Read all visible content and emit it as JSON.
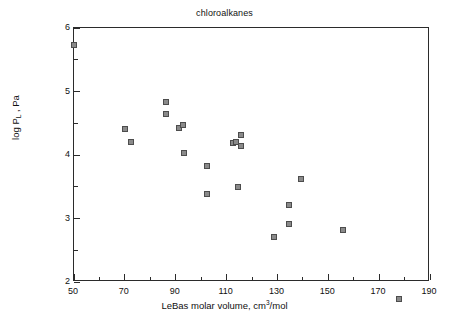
{
  "chart_data": {
    "type": "scatter",
    "title": "chloroalkanes",
    "xlabel_parts": {
      "prefix": "LeBas molar volume, cm",
      "superscript": "3",
      "suffix": "/mol"
    },
    "xlabel": "LeBas molar volume, cm3/mol",
    "ylabel_parts": {
      "prefix": "log P",
      "subscript": "L",
      "suffix": " , Pa"
    },
    "ylabel": "log P_L , Pa",
    "xlim": [
      50,
      190
    ],
    "ylim": [
      2,
      6
    ],
    "xticks": [
      50,
      70,
      90,
      110,
      130,
      150,
      170,
      190
    ],
    "xticklabels": [
      "50",
      "70",
      "90",
      "110",
      "130",
      "150",
      "170",
      "190"
    ],
    "xminorticks": [
      60,
      80,
      100,
      120,
      140,
      160,
      180
    ],
    "yticks": [
      2,
      3,
      4,
      5,
      6
    ],
    "yticklabels": [
      "2",
      "3",
      "4",
      "5",
      "6"
    ],
    "yminorticks": [
      2.5,
      3.5,
      4.5,
      5.5
    ],
    "grid": false,
    "legend": null,
    "marker": {
      "shape": "square",
      "fill_color": "#8a8a8a",
      "edge_color": "#4d4d4d",
      "size_px": 6
    },
    "frame_color": "#2b2b2b",
    "background_color": "#ffffff",
    "points": [
      {
        "x": 50.0,
        "y": 5.74
      },
      {
        "x": 70.1,
        "y": 4.41
      },
      {
        "x": 72.4,
        "y": 4.2
      },
      {
        "x": 86.2,
        "y": 4.84
      },
      {
        "x": 86.2,
        "y": 4.65
      },
      {
        "x": 91.3,
        "y": 4.42
      },
      {
        "x": 92.9,
        "y": 4.47
      },
      {
        "x": 93.3,
        "y": 4.03
      },
      {
        "x": 102.3,
        "y": 3.82
      },
      {
        "x": 102.3,
        "y": 3.39
      },
      {
        "x": 112.5,
        "y": 4.19
      },
      {
        "x": 113.7,
        "y": 4.21
      },
      {
        "x": 115.7,
        "y": 4.31
      },
      {
        "x": 115.7,
        "y": 4.14
      },
      {
        "x": 114.5,
        "y": 3.5
      },
      {
        "x": 128.6,
        "y": 2.71
      },
      {
        "x": 134.5,
        "y": 3.22
      },
      {
        "x": 134.5,
        "y": 2.91
      },
      {
        "x": 139.2,
        "y": 3.62
      },
      {
        "x": 155.7,
        "y": 2.82
      },
      {
        "x": 177.8,
        "y": 1.73
      }
    ]
  }
}
